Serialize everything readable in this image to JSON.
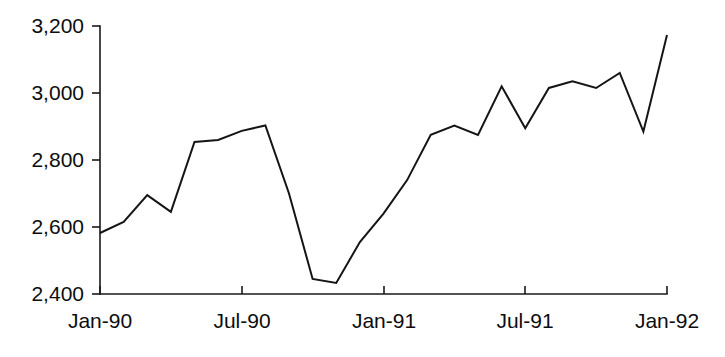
{
  "chart_data": {
    "type": "line",
    "title": "",
    "subtitle": "",
    "xlabel": "",
    "ylabel": "",
    "grid": false,
    "legend": false,
    "legend_position": "none",
    "line_color": "#151515",
    "axis_color": "#1a1a1a",
    "background_color": "#ffffff",
    "ylim": [
      2400,
      3200
    ],
    "yticks": [
      2400,
      2600,
      2800,
      3000,
      3200
    ],
    "ytick_labels": [
      "2,400",
      "2,600",
      "2,800",
      "3,000",
      "3,200"
    ],
    "xlim": [
      "Jan-90",
      "Jan-92"
    ],
    "xticks": [
      "Jan-90",
      "Jul-90",
      "Jan-91",
      "Jul-91",
      "Jan-92"
    ],
    "xtick_labels": [
      "Jan-90",
      "Jul-90",
      "Jan-91",
      "Jul-91",
      "Jan-92"
    ],
    "x": [
      "Jan-90",
      "Feb-90",
      "Mar-90",
      "Apr-90",
      "May-90",
      "Jun-90",
      "Jul-90",
      "Aug-90",
      "Sep-90",
      "Oct-90",
      "Nov-90",
      "Dec-90",
      "Jan-91",
      "Feb-91",
      "Mar-91",
      "Apr-91",
      "May-91",
      "Jun-91",
      "Jul-91",
      "Aug-91",
      "Sep-91",
      "Oct-91",
      "Nov-91",
      "Dec-91",
      "Jan-92"
    ],
    "values": [
      2582,
      2615,
      2695,
      2645,
      2854,
      2860,
      2887,
      2903,
      2700,
      2445,
      2433,
      2555,
      2640,
      2740,
      2875,
      2903,
      2875,
      3020,
      2895,
      3015,
      3035,
      3015,
      3060,
      2885,
      3173
    ],
    "series": [
      {
        "name": "series-1",
        "color": "#151515",
        "values": [
          2582,
          2615,
          2695,
          2645,
          2854,
          2860,
          2887,
          2903,
          2700,
          2445,
          2433,
          2555,
          2640,
          2740,
          2875,
          2903,
          2875,
          3020,
          2895,
          3015,
          3035,
          3015,
          3060,
          2885,
          3173
        ]
      }
    ]
  },
  "geometry": {
    "plot_left": 100,
    "plot_right": 667,
    "plot_top": 26,
    "plot_bottom": 294,
    "tick_length": 8,
    "x_tick_positions": [
      100,
      242,
      384,
      525,
      667
    ],
    "y_tick_positions": [
      294,
      227,
      160,
      93,
      26
    ]
  }
}
